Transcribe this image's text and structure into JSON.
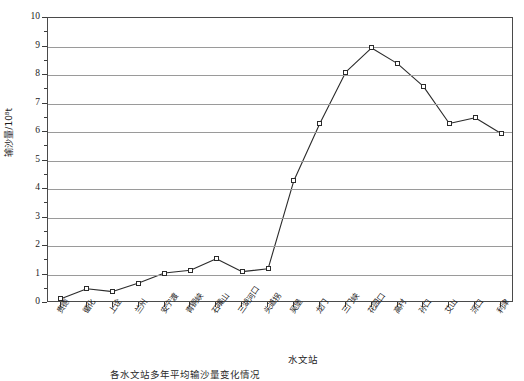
{
  "chart_data": {
    "type": "line",
    "title": "",
    "xlabel": "水文站",
    "ylabel": "输沙量/10⁸t",
    "ylim": [
      0,
      10
    ],
    "yticks": [
      0,
      1,
      2,
      3,
      4,
      5,
      6,
      7,
      8,
      9,
      10
    ],
    "ytick_labels": [
      "0",
      "1",
      "2",
      "3",
      "4",
      "5",
      "6",
      "7",
      "8",
      "9",
      "10"
    ],
    "minor_yticks": [
      0.5,
      1.5,
      2.5,
      3.5,
      4.5,
      5.5,
      6.5,
      7.5,
      8.5,
      9.5
    ],
    "grid": "horizontal",
    "legend": "none",
    "marker": "open-square",
    "line_color": "#2b2b2b",
    "grid_color": "#9a9a9a",
    "axis_color": "#4a4a4a",
    "categories": [
      "贵德",
      "循化",
      "上诠",
      "兰州",
      "安宁渡",
      "青铜峡",
      "石嘴山",
      "三湖河口",
      "头道拐",
      "吴堡",
      "龙门",
      "三门峡",
      "花园口",
      "高村",
      "孙口",
      "艾山",
      "泺口",
      "利津"
    ],
    "values": [
      0.15,
      0.5,
      0.4,
      0.7,
      1.05,
      1.15,
      1.55,
      1.1,
      1.2,
      4.3,
      6.3,
      8.1,
      8.95,
      8.4,
      7.6,
      6.3,
      6.5,
      5.95
    ]
  },
  "caption": "各水文站多年平均输沙量变化情况"
}
